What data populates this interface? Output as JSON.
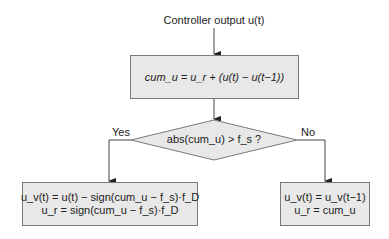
{
  "diagram": {
    "input_label": "Controller output u(t)",
    "process_box": "cum_u = u_r + (u(t) − u(t−1))",
    "decision": "abs(cum_u) > f_s ?",
    "yes_label": "Yes",
    "no_label": "No",
    "yes_box": {
      "line1": "u_v(t) = u(t) − sign(cum_u − f_s)·f_D",
      "line2": "u_r = sign(cum_u − f_s)·f_D"
    },
    "no_box": {
      "line1": "u_v(t) = u_v(t−1)",
      "line2": "u_r = cum_u"
    }
  },
  "colors": {
    "box_fill": "#e8e8e8",
    "box_border": "#7a7a7a",
    "line": "#333333"
  }
}
